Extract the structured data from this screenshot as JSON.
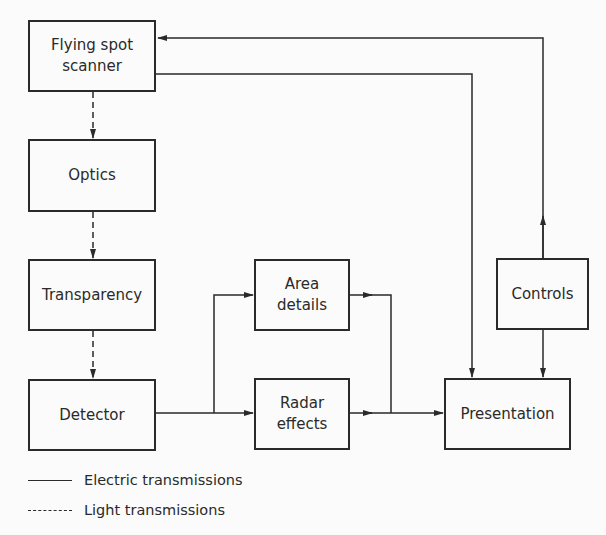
{
  "diagram": {
    "nodes": {
      "scanner": {
        "label": "Flying spot\nscanner"
      },
      "optics": {
        "label": "Optics"
      },
      "transparency": {
        "label": "Transparency"
      },
      "detector": {
        "label": "Detector"
      },
      "area": {
        "label": "Area\ndetails"
      },
      "radar": {
        "label": "Radar\neffects"
      },
      "controls": {
        "label": "Controls"
      },
      "presentation": {
        "label": "Presentation"
      }
    },
    "edges": [
      {
        "from": "Flying spot scanner",
        "to": "Optics",
        "type": "light"
      },
      {
        "from": "Optics",
        "to": "Transparency",
        "type": "light"
      },
      {
        "from": "Transparency",
        "to": "Detector",
        "type": "light"
      },
      {
        "from": "Detector",
        "to": "Area details",
        "type": "electric"
      },
      {
        "from": "Detector",
        "to": "Radar effects",
        "type": "electric"
      },
      {
        "from": "Area details",
        "to": "Presentation",
        "type": "electric"
      },
      {
        "from": "Radar effects",
        "to": "Presentation",
        "type": "electric"
      },
      {
        "from": "Flying spot scanner",
        "to": "Presentation",
        "type": "electric"
      },
      {
        "from": "Controls",
        "to": "Presentation",
        "type": "electric"
      },
      {
        "from": "Controls",
        "to": "Flying spot scanner",
        "type": "electric"
      }
    ],
    "legend": {
      "electric": "Electric transmissions",
      "light": "Light transmissions"
    },
    "colors": {
      "line": "#2a2a2a",
      "background": "#fbfbfb"
    }
  }
}
